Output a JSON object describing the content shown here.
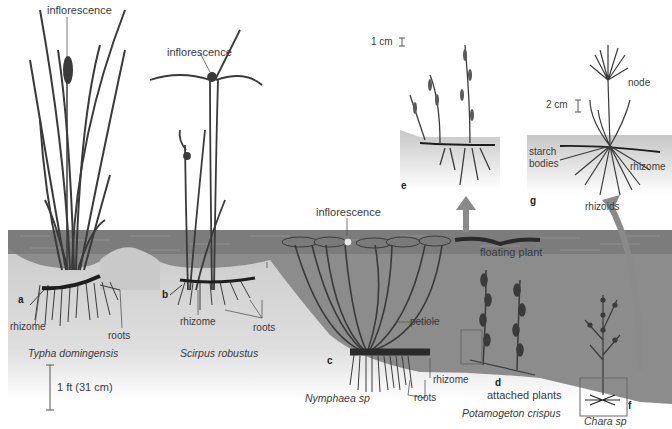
{
  "colors": {
    "background": "#ffffff",
    "water_surface": "#7a7a7a",
    "water_deep": "#8c8c8c",
    "sediment": "#c9c9c9",
    "sediment_light": "#e6e6e6",
    "plant": "#3a3a3a",
    "rhizome": "#1e1e1e",
    "arrow": "#8a8a8a",
    "inset_bg": "#c8c8c8"
  },
  "panels": {
    "a": {
      "letter": "a",
      "species": "Typha domingensis",
      "labels": {
        "inflorescence": "inflorescence",
        "rhizome": "rhizome",
        "roots": "roots"
      }
    },
    "b": {
      "letter": "b",
      "species": "Scirpus robustus",
      "labels": {
        "inflorescence": "inflorescence",
        "rhizome": "rhizome",
        "roots": "roots"
      }
    },
    "c": {
      "letter": "c",
      "species": "Nymphaea sp",
      "labels": {
        "inflorescence": "inflorescence",
        "petiole": "petiole",
        "rhizome": "rhizome",
        "roots": "roots"
      }
    },
    "d": {
      "letter": "d",
      "species": "Potamogeton crispus",
      "labels": {
        "attached": "attached plants",
        "floating": "floating plant"
      }
    },
    "e": {
      "letter": "e",
      "scale": "1 cm"
    },
    "f": {
      "letter": "f",
      "species": "Chara sp"
    },
    "g": {
      "letter": "g",
      "scale": "2 cm",
      "labels": {
        "node": "node",
        "starch": "starch",
        "bodies": "bodies",
        "rhizome": "rhizome",
        "rhizoids": "rhizoids"
      }
    }
  },
  "scale_bar": {
    "label": "1 ft (31 cm)"
  }
}
